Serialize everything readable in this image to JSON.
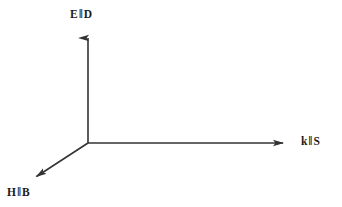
{
  "figure": {
    "type": "vector-axes-diagram",
    "background_color": "#ffffff",
    "line_color": "#333333",
    "text_color": "#1a1a1a"
  },
  "axes": [
    {
      "id": "vertical",
      "name": "e-d-axis",
      "label_symbol_1": "E",
      "label_separator": "‖",
      "label_symbol_2": "D",
      "label_text": "E ‖ D",
      "origin_x": 88,
      "origin_y": 143,
      "tip_x": 88,
      "tip_y": 28,
      "direction": "up"
    },
    {
      "id": "horizontal",
      "name": "k-s-axis",
      "label_symbol_1": "k",
      "label_separator": "‖",
      "label_symbol_2": "S",
      "label_text": "k ‖ S",
      "origin_x": 88,
      "origin_y": 143,
      "tip_x": 293,
      "tip_y": 143,
      "direction": "right"
    },
    {
      "id": "diagonal",
      "name": "h-b-axis",
      "label_symbol_1": "H",
      "label_separator": "‖",
      "label_symbol_2": "B",
      "label_text": "H ‖ B",
      "origin_x": 88,
      "origin_y": 143,
      "tip_x": 28,
      "tip_y": 182,
      "direction": "down-left"
    }
  ],
  "labels": {
    "vertical": {
      "sym1": "E",
      "sep": "‖",
      "sym2": "D"
    },
    "horizontal": {
      "sym1": "k",
      "sep": "‖",
      "sym2": "S"
    },
    "diagonal": {
      "sym1": "H",
      "sep": "‖",
      "sym2": "B"
    }
  }
}
